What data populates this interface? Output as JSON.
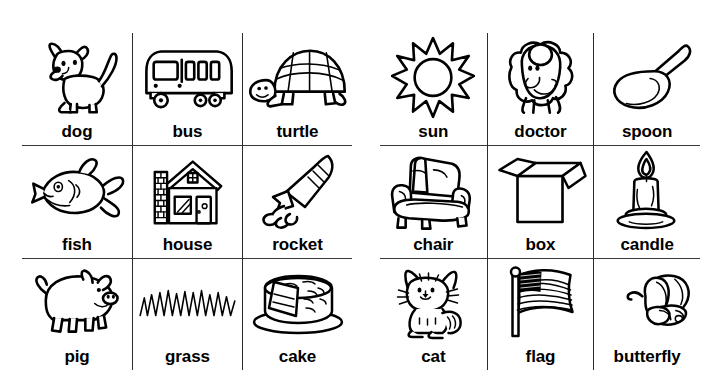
{
  "worksheet": {
    "background_color": "#ffffff",
    "ink_color": "#000000",
    "rule_color": "#3a3a3a",
    "panels": [
      {
        "name": "left-panel",
        "rows": [
          [
            {
              "label": "dog",
              "icon": "dog-icon"
            },
            {
              "label": "bus",
              "icon": "bus-icon"
            },
            {
              "label": "turtle",
              "icon": "turtle-icon"
            }
          ],
          [
            {
              "label": "fish",
              "icon": "fish-icon"
            },
            {
              "label": "house",
              "icon": "house-icon"
            },
            {
              "label": "rocket",
              "icon": "rocket-icon"
            }
          ],
          [
            {
              "label": "pig",
              "icon": "pig-icon"
            },
            {
              "label": "grass",
              "icon": "grass-icon"
            },
            {
              "label": "cake",
              "icon": "cake-icon"
            }
          ]
        ]
      },
      {
        "name": "right-panel",
        "rows": [
          [
            {
              "label": "sun",
              "icon": "sun-icon"
            },
            {
              "label": "doctor",
              "icon": "doctor-icon"
            },
            {
              "label": "spoon",
              "icon": "spoon-icon"
            }
          ],
          [
            {
              "label": "chair",
              "icon": "chair-icon"
            },
            {
              "label": "box",
              "icon": "box-icon"
            },
            {
              "label": "candle",
              "icon": "candle-icon"
            }
          ],
          [
            {
              "label": "cat",
              "icon": "cat-icon"
            },
            {
              "label": "flag",
              "icon": "flag-icon"
            },
            {
              "label": "butterfly",
              "icon": "butterfly-icon"
            }
          ]
        ]
      }
    ]
  }
}
